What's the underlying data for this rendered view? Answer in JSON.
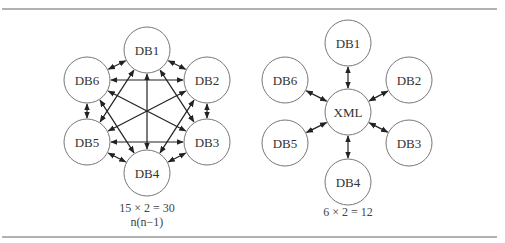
{
  "figure": {
    "left": {
      "nodes": [
        {
          "id": "DB1",
          "label": "DB1",
          "x": 147,
          "y": 50
        },
        {
          "id": "DB2",
          "label": "DB2",
          "x": 207,
          "y": 80
        },
        {
          "id": "DB3",
          "label": "DB3",
          "x": 207,
          "y": 142
        },
        {
          "id": "DB4",
          "label": "DB4",
          "x": 147,
          "y": 173
        },
        {
          "id": "DB5",
          "label": "DB5",
          "x": 87,
          "y": 142
        },
        {
          "id": "DB6",
          "label": "DB6",
          "x": 87,
          "y": 80
        }
      ],
      "topology": "full-mesh",
      "caption_line1": "15 × 2 = 30",
      "caption_line2": "n(n−1)"
    },
    "right": {
      "hub": {
        "id": "XML",
        "label": "XML",
        "x": 348,
        "y": 112
      },
      "nodes": [
        {
          "id": "DB1",
          "label": "DB1",
          "x": 348,
          "y": 43
        },
        {
          "id": "DB2",
          "label": "DB2",
          "x": 409,
          "y": 80
        },
        {
          "id": "DB3",
          "label": "DB3",
          "x": 409,
          "y": 143
        },
        {
          "id": "DB4",
          "label": "DB4",
          "x": 348,
          "y": 182
        },
        {
          "id": "DB5",
          "label": "DB5",
          "x": 285,
          "y": 143
        },
        {
          "id": "DB6",
          "label": "DB6",
          "x": 285,
          "y": 80
        }
      ],
      "topology": "hub-and-spoke",
      "caption": "6 × 2 = 12"
    },
    "node_radius": 23
  }
}
